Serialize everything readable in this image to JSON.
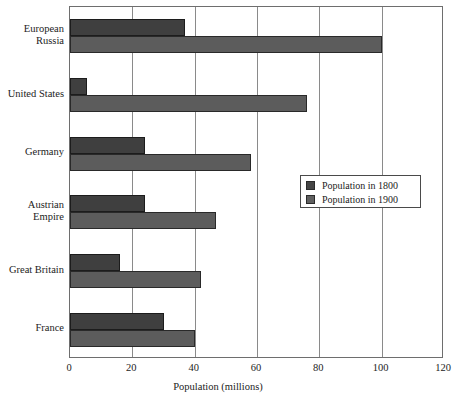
{
  "chart_data": {
    "type": "bar",
    "orientation": "horizontal",
    "title": "",
    "xlabel": "Population (millions)",
    "ylabel": "",
    "xlim": [
      0,
      120
    ],
    "xticks": [
      0,
      20,
      40,
      60,
      80,
      100,
      120
    ],
    "xtick_labels": [
      "0",
      "20",
      "40",
      "60",
      "80",
      "100",
      "120"
    ],
    "grid": "vertical",
    "legend_position": "center-right",
    "categories": [
      "European\nRussia",
      "United States",
      "Germany",
      "Austrian\nEmpire",
      "Great Britain",
      "France"
    ],
    "series": [
      {
        "name": "Population in 1800",
        "color": "#3f3f3f",
        "values": [
          37,
          5.5,
          24,
          24,
          16,
          30
        ]
      },
      {
        "name": "Population in 1900",
        "color": "#5c5c5c",
        "values": [
          100,
          76,
          58,
          47,
          42,
          40
        ]
      }
    ]
  },
  "legend": {
    "entries": [
      {
        "label": "Population in 1800"
      },
      {
        "label": "Population in 1900"
      }
    ]
  }
}
